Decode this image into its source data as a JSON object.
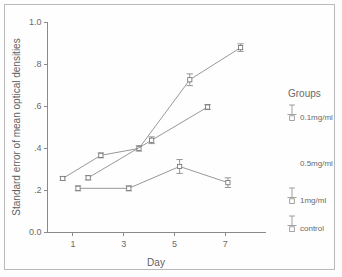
{
  "chart_data": {
    "type": "line",
    "title": "",
    "xlabel": "Day",
    "ylabel": "Standard error of mean optical densities",
    "xlim": [
      0,
      8.6
    ],
    "ylim": [
      0.0,
      1.0
    ],
    "grid": false,
    "legend_position": "right",
    "legend_title": "Groups",
    "xticks": [
      1,
      3,
      5,
      7
    ],
    "xtick_labels": [
      "1",
      "3",
      "5",
      "7"
    ],
    "yticks": [
      0.0,
      0.2,
      0.4,
      0.6,
      0.8,
      1.0
    ],
    "ytick_labels": [
      "0.0",
      ".2",
      ".4",
      ".6",
      ".8",
      "1.0"
    ],
    "series": [
      {
        "name": "0.1mg/ml",
        "x": [
          0.6,
          2.1,
          3.6,
          5.6,
          7.6
        ],
        "values": [
          0.255,
          0.365,
          0.398,
          0.725,
          0.878
        ],
        "errors": [
          0.008,
          0.012,
          0.013,
          0.028,
          0.018
        ]
      },
      {
        "name": "0.5mg/ml",
        "x": [
          1.6,
          4.1,
          6.3
        ],
        "values": [
          0.258,
          0.437,
          0.595
        ],
        "errors": [
          0.01,
          0.016,
          0.012
        ]
      },
      {
        "name": "1mg/ml",
        "x": [
          1.2,
          3.2,
          5.2,
          7.1
        ],
        "values": [
          0.208,
          0.208,
          0.312,
          0.235
        ],
        "errors": [
          0.012,
          0.012,
          0.033,
          0.023
        ]
      },
      {
        "name": "control",
        "x": [],
        "values": [],
        "errors": []
      }
    ]
  },
  "legend": {
    "title": "Groups",
    "entries": [
      {
        "label": "0.1mg/ml"
      },
      {
        "label": "0.5mg/ml"
      },
      {
        "label": "1mg/ml"
      },
      {
        "label": "control"
      }
    ]
  },
  "axes": {
    "x_title": "Day",
    "y_title": "Standard error of mean optical densities",
    "x_tick_labels": [
      "1",
      "3",
      "5",
      "7"
    ],
    "y_tick_labels": [
      "1.0",
      ".8",
      ".6",
      ".4",
      ".2",
      "0.0"
    ]
  },
  "colors": {
    "line": "#7d7d7d",
    "axis": "#8a8a8a",
    "text": "#6a6a6a",
    "frame": "#b9b9b9",
    "background": "#fefefe"
  }
}
